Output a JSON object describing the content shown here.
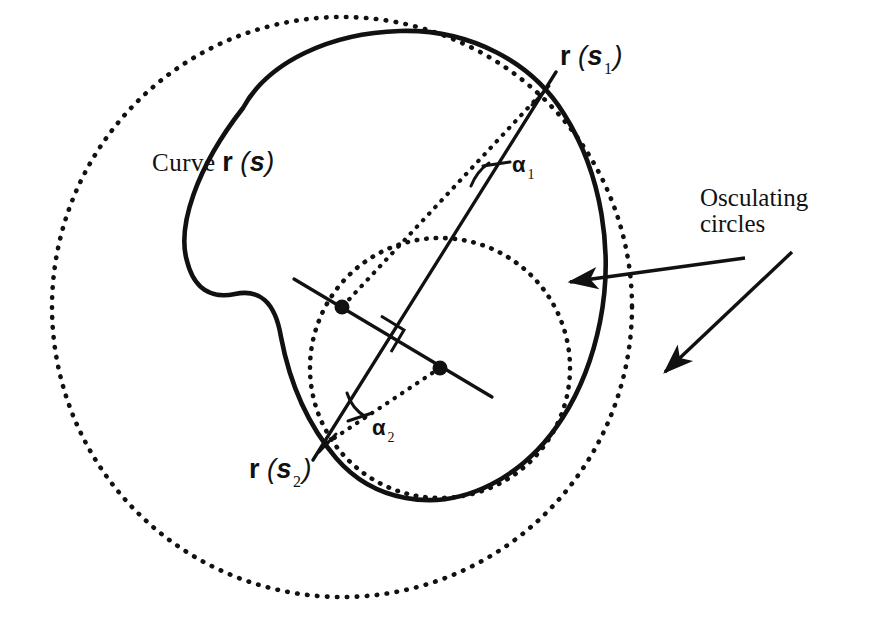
{
  "figure": {
    "domain": "diagram",
    "title_visible": false,
    "background_color": "#ffffff",
    "ink_color": "#111111",
    "width": 873,
    "height": 624
  },
  "labels": {
    "curve": {
      "prefix": "Curve",
      "vector": "r",
      "arg_open": "(",
      "arg": "s",
      "arg_close": ")"
    },
    "point1": {
      "vector": "r",
      "arg_open": "(",
      "arg": "s",
      "subscript": "1",
      "arg_close": ")"
    },
    "point2": {
      "vector": "r",
      "arg_open": "(",
      "arg": "s",
      "subscript": "2",
      "arg_close": ")"
    },
    "osculating": {
      "line1": "Osculating",
      "line2": "circles"
    },
    "angle1": {
      "symbol": "α",
      "subscript": "1"
    },
    "angle2": {
      "symbol": "α",
      "subscript": "2"
    }
  },
  "geometry": {
    "closed_curve": {
      "name": "curve-r-s",
      "style": "solid",
      "stroke_width": 4.5,
      "path": "M 243 108 C 268 62, 330 33, 400 31 C 470 29, 530 60, 562 110 C 600 168, 612 250, 598 320 C 584 390, 548 452, 490 482 C 432 512, 372 500, 336 460 C 300 420, 286 372, 280 336 C 274 300, 260 290, 236 294 C 212 298, 196 290, 188 262 C 178 228, 196 168, 243 108 Z"
    },
    "big_osculating_circle": {
      "name": "large-osculating-circle",
      "style": "dotted",
      "cx": 342,
      "cy": 307,
      "r": 290,
      "stroke_width": 4.5,
      "dash": "1 9"
    },
    "small_osculating_circle": {
      "name": "small-osculating-circle",
      "style": "dotted",
      "cx": 440,
      "cy": 368,
      "r": 130,
      "stroke_width": 4.5,
      "dash": "1 9"
    },
    "points": [
      {
        "name": "point-r-s1",
        "x": 540,
        "y": 95
      },
      {
        "name": "point-r-s2",
        "x": 327,
        "y": 443
      }
    ],
    "centers": [
      {
        "name": "center-large-circle",
        "x": 342,
        "y": 307
      },
      {
        "name": "center-small-circle",
        "x": 440,
        "y": 368
      }
    ],
    "chord": {
      "name": "chord-line",
      "style": "solid",
      "x1": 552,
      "y1": 78,
      "x2": 316,
      "y2": 456,
      "stroke_width": 3.2
    },
    "center_line": {
      "name": "center-connecting-line",
      "style": "solid",
      "x1": 297,
      "y1": 281,
      "x2": 489,
      "y2": 395,
      "stroke_width": 3.2
    },
    "radius_lines": [
      {
        "name": "radius-line-1",
        "style": "dotted",
        "x1": 540,
        "y1": 95,
        "x2": 342,
        "y2": 307
      },
      {
        "name": "radius-line-2",
        "style": "dotted",
        "x1": 327,
        "y1": 443,
        "x2": 440,
        "y2": 368
      }
    ],
    "right_angle_marker": {
      "name": "right-angle-marker",
      "x": 398,
      "y": 330,
      "size": 26
    },
    "arrows": [
      {
        "name": "arrow-to-small-circle",
        "x1": 745,
        "y1": 257,
        "x2": 565,
        "y2": 282,
        "note": "points left at small osculating circle"
      },
      {
        "name": "arrow-to-large-circle",
        "x1": 790,
        "y1": 252,
        "x2": 660,
        "y2": 375,
        "note": "points down-left at large osculating circle"
      }
    ]
  }
}
